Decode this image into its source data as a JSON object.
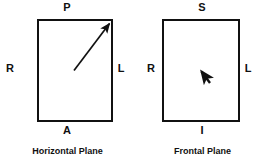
{
  "figure": {
    "background_color": "#ffffff",
    "stroke_color": "#111111",
    "text_color": "#101010"
  },
  "diagrams": [
    {
      "id": "horizontal-plane",
      "caption": "Horizontal Plane",
      "labels": {
        "top": "P",
        "left": "R",
        "right": "L",
        "bottom": "A"
      },
      "vector": {
        "name": "oblique-direction-arrow",
        "description": "long arrow from center to upper-right corner",
        "from": [
          74,
          70
        ],
        "to": [
          111,
          22
        ]
      }
    },
    {
      "id": "frontal-plane",
      "caption": "Frontal Plane",
      "labels": {
        "top": "S",
        "left": "R",
        "right": "L",
        "bottom": "I"
      },
      "vector": {
        "name": "short-direction-arrow",
        "description": "short thick arrow from lower-right to upper-left near center",
        "from": [
          75,
          83
        ],
        "to": [
          64,
          68
        ]
      }
    }
  ]
}
